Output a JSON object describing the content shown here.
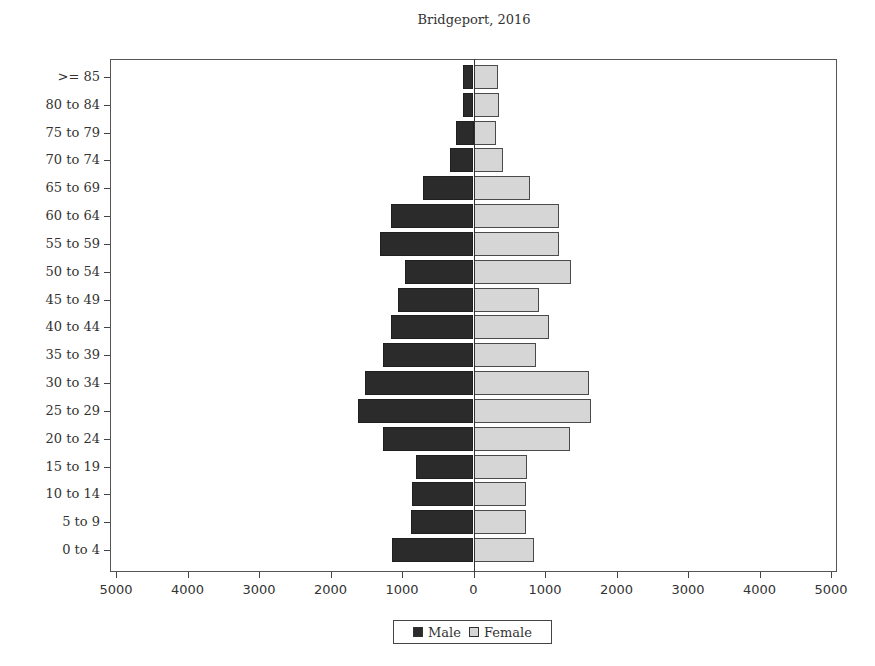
{
  "chart_data": {
    "type": "bar",
    "orientation": "horizontal",
    "subtype": "population-pyramid",
    "title": "Bridgeport, 2016",
    "xlabel": "",
    "ylabel": "",
    "xlim": [
      -5000,
      5000
    ],
    "x_ticks": [
      -5000,
      -4000,
      -3000,
      -2000,
      -1000,
      0,
      1000,
      2000,
      3000,
      4000,
      5000
    ],
    "x_tick_labels": [
      "5000",
      "4000",
      "3000",
      "2000",
      "1000",
      "0",
      "1000",
      "2000",
      "3000",
      "4000",
      "5000"
    ],
    "grid": false,
    "legend_position": "bottom",
    "categories": [
      ">= 85",
      "80 to 84",
      "75 to 79",
      "70 to 74",
      "65 to 69",
      "60 to 64",
      "55 to 59",
      "50 to 54",
      "45 to 49",
      "40 to 44",
      "35 to 39",
      "30 to 34",
      "25 to 29",
      "20 to 24",
      "15 to 19",
      "10 to 14",
      "5 to 9",
      "0 to 4"
    ],
    "series": [
      {
        "name": "Male",
        "color": "#2b2b2b",
        "values": [
          140,
          140,
          250,
          330,
          710,
          1160,
          1310,
          960,
          1050,
          1160,
          1260,
          1520,
          1620,
          1270,
          800,
          860,
          870,
          1140
        ]
      },
      {
        "name": "Female",
        "color": "#d6d6d6",
        "values": [
          340,
          350,
          320,
          410,
          790,
          1190,
          1200,
          1370,
          910,
          1060,
          880,
          1620,
          1650,
          1350,
          750,
          740,
          740,
          850
        ]
      }
    ]
  }
}
